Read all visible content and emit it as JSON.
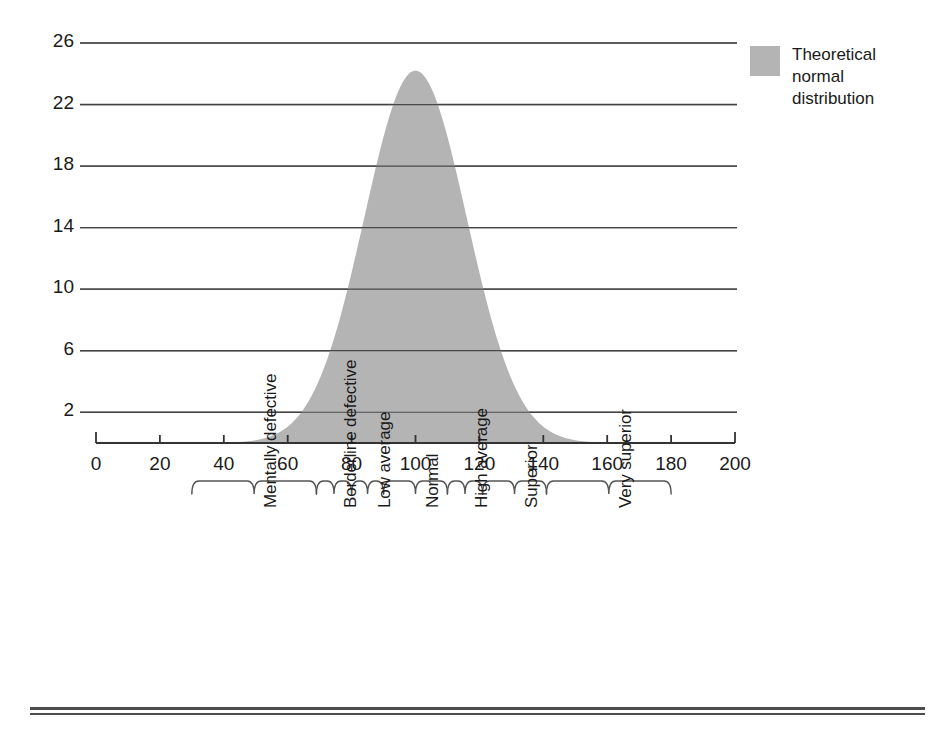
{
  "chart_data": {
    "type": "area",
    "title": "",
    "subtitle": "",
    "xlabel": "",
    "ylabel": "Percentage of test group",
    "xlim": [
      0,
      200
    ],
    "ylim": [
      0,
      27.3
    ],
    "grid": true,
    "legend_position": "right",
    "x_ticks": [
      "0",
      "20",
      "40",
      "60",
      "80",
      "100",
      "120",
      "140",
      "160",
      "180",
      "200"
    ],
    "x_tick_values": [
      0,
      20,
      40,
      60,
      80,
      100,
      120,
      140,
      160,
      180,
      200
    ],
    "y_ticks": [
      "2",
      "6",
      "10",
      "14",
      "18",
      "22",
      "26"
    ],
    "y_tick_values": [
      2,
      6,
      10,
      14,
      18,
      22,
      26
    ],
    "series": [
      {
        "name": "Theoretical normal distribution",
        "color": "#b4b4b4",
        "mean": 100,
        "sigma": 16,
        "peak_value": 24.2,
        "x": [
          30,
          35,
          40,
          45,
          50,
          55,
          60,
          65,
          70,
          75,
          80,
          85,
          90,
          95,
          100,
          105,
          110,
          115,
          120,
          125,
          130,
          135,
          140,
          145,
          150,
          155,
          160,
          165,
          170
        ],
        "values": [
          0.0,
          0.1,
          0.2,
          0.4,
          0.8,
          1.5,
          2.7,
          4.5,
          7.0,
          10.2,
          13.9,
          17.7,
          21.1,
          23.4,
          24.2,
          23.4,
          21.1,
          17.7,
          13.9,
          10.2,
          7.0,
          4.5,
          2.7,
          1.5,
          0.8,
          0.4,
          0.2,
          0.1,
          0.0
        ]
      }
    ],
    "categories": [
      {
        "label": "Mentally defective",
        "from": 30,
        "to": 69
      },
      {
        "label": "Borderline defective",
        "from": 69,
        "to": 80
      },
      {
        "label": "Low average",
        "from": 80,
        "to": 90
      },
      {
        "label": "Normal",
        "from": 90,
        "to": 110
      },
      {
        "label": "High average",
        "from": 110,
        "to": 121
      },
      {
        "label": "Superior",
        "from": 121,
        "to": 141
      },
      {
        "label": "Very superior",
        "from": 141,
        "to": 180
      }
    ]
  },
  "legend": {
    "swatch_color": "#b4b4b4",
    "lines": [
      "Theoretical",
      "normal",
      "distribution"
    ]
  },
  "axis": {
    "y_title": "Percentage of test group"
  },
  "colors": {
    "fill": "#b4b4b4",
    "line": "#333333",
    "grid": "#444444",
    "rule": "#4d4d4d"
  }
}
